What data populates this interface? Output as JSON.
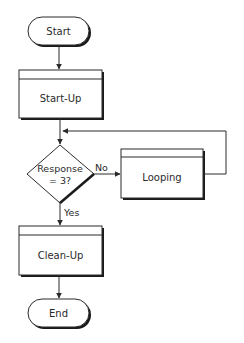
{
  "diagram": {
    "type": "flowchart",
    "nodes": {
      "start": {
        "label": "Start",
        "shape": "terminal"
      },
      "startup": {
        "label": "Start-Up",
        "shape": "predefined-process"
      },
      "decision": {
        "line1": "Response",
        "line2": "= 3?",
        "shape": "decision"
      },
      "looping": {
        "label": "Looping",
        "shape": "predefined-process"
      },
      "cleanup": {
        "label": "Clean-Up",
        "shape": "predefined-process"
      },
      "end": {
        "label": "End",
        "shape": "terminal"
      }
    },
    "edges": {
      "no_label": "No",
      "yes_label": "Yes"
    },
    "colors": {
      "stroke": "#2a2a2a",
      "shadow": "#1a1a1a",
      "fill": "#ffffff",
      "background": "#ffffff"
    }
  }
}
